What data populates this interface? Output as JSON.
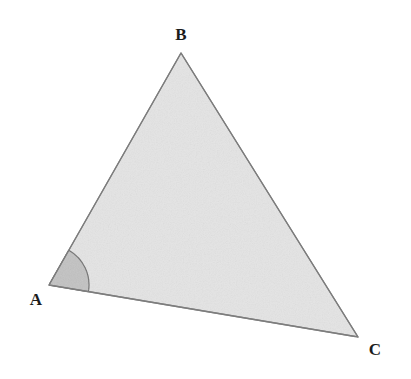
{
  "figure": {
    "kind": "geometry-diagram",
    "shape": "triangle",
    "canvas": {
      "width": 411,
      "height": 379
    },
    "background_color": "#ffffff"
  },
  "style": {
    "fill_color": "#e4e4e4",
    "stroke_color": "#7d7d7d",
    "stroke_width": 1.3,
    "angle_fill_color": "#c2c2c2",
    "angle_stroke_color": "#6f6f6f",
    "label_color": "#1c1c1c",
    "label_font_size": 17
  },
  "vertices": [
    {
      "id": "A",
      "label": "A",
      "x": 49,
      "y": 285,
      "label_x": 36,
      "label_y": 301
    },
    {
      "id": "B",
      "label": "B",
      "x": 181,
      "y": 53,
      "label_x": 181,
      "label_y": 36
    },
    {
      "id": "C",
      "label": "C",
      "x": 358,
      "y": 337,
      "label_x": 375,
      "label_y": 351
    }
  ],
  "edges": [
    {
      "id": "AB",
      "from": "A",
      "to": "B"
    },
    {
      "id": "BC",
      "from": "B",
      "to": "C"
    },
    {
      "id": "CA",
      "from": "C",
      "to": "A"
    }
  ],
  "angle_marker": {
    "at_vertex": "A",
    "radius": 40,
    "shape": "filled-sector",
    "path": "M 49 285 L 71.7 252.1 A 40 40 0 0 1 88.6 292.3 Z"
  },
  "geometry": {
    "triangle_path": "M 49 285 L 181 53 L 358 337 Z"
  }
}
